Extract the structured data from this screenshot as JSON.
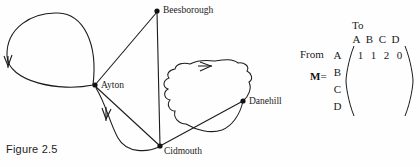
{
  "figure": {
    "caption": "Figure 2.5"
  },
  "graph": {
    "nodes": [
      {
        "id": "A",
        "label": "Ayton",
        "x": 95,
        "y": 85
      },
      {
        "id": "B",
        "label": "Beesborough",
        "x": 157,
        "y": 11
      },
      {
        "id": "C",
        "label": "Cidmouth",
        "x": 160,
        "y": 146
      },
      {
        "id": "D",
        "label": "Danehill",
        "x": 243,
        "y": 101
      }
    ],
    "edges": [
      {
        "from": "A",
        "to": "A",
        "kind": "self-loop-ellipse",
        "arrow": "down"
      },
      {
        "from": "A",
        "to": "B",
        "kind": "straight"
      },
      {
        "from": "B",
        "to": "C",
        "kind": "straight-vertical"
      },
      {
        "from": "A",
        "to": "C",
        "kind": "straight"
      },
      {
        "from": "A",
        "to": "C",
        "kind": "curved",
        "arrow": "down"
      },
      {
        "from": "C",
        "to": "D",
        "kind": "straight"
      },
      {
        "from": "D",
        "to": "D",
        "kind": "self-loop-wobbly",
        "arrow": "right"
      }
    ],
    "stroke_color": "#1c1c1c"
  },
  "matrix": {
    "to_label": "To",
    "from_label": "From",
    "name_label": "M",
    "equals_label": "=",
    "column_headers": [
      "A",
      "B",
      "C",
      "D"
    ],
    "row_headers": [
      "A",
      "B",
      "C",
      "D"
    ],
    "rows": [
      [
        "1",
        "1",
        "2",
        "0"
      ],
      [
        "",
        "",
        "",
        ""
      ],
      [
        "",
        "",
        "",
        ""
      ],
      [
        "",
        "",
        "",
        ""
      ]
    ]
  }
}
